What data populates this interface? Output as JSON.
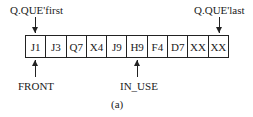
{
  "labels": {
    "first": "Q.QUE'first",
    "last": "Q.QUE'last",
    "front": "FRONT",
    "in_use": "IN_USE",
    "caption": "(a)"
  },
  "cells": [
    "J1",
    "J3",
    "Q7",
    "X4",
    "J9",
    "H9",
    "F4",
    "D7",
    "XX",
    "XX"
  ]
}
